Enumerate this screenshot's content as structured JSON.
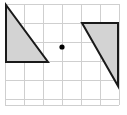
{
  "figure": {
    "type": "geometry-diagram",
    "canvas": {
      "width": 127,
      "height": 115
    },
    "background_color": "#ffffff"
  },
  "grid": {
    "name": "square-grid",
    "line_color": "#cfcfcf",
    "cell_size": 19,
    "columns": 6,
    "rows": 6,
    "origin_x": 5,
    "origin_y": 4,
    "x_positions": [
      5,
      24,
      43,
      62,
      81,
      100,
      119
    ],
    "y_positions": [
      4,
      23,
      42,
      61,
      80,
      99,
      105
    ]
  },
  "shapes": [
    {
      "name": "left-triangle",
      "kind": "right-triangle",
      "fill_color": "#d3d3d3",
      "stroke_color": "#1a1a1a",
      "stroke_width": 2,
      "points": "6,5 6,62 48,62",
      "vertices": [
        {
          "label": "top-left",
          "x": 6,
          "y": 5
        },
        {
          "label": "bottom-left",
          "x": 6,
          "y": 62
        },
        {
          "label": "bottom-right",
          "x": 48,
          "y": 62
        }
      ]
    },
    {
      "name": "right-triangle",
      "kind": "right-triangle",
      "fill_color": "#d3d3d3",
      "stroke_color": "#1a1a1a",
      "stroke_width": 2,
      "points": "82,23 118,23 118,86",
      "vertices": [
        {
          "label": "top-left",
          "x": 82,
          "y": 23
        },
        {
          "label": "top-right",
          "x": 118,
          "y": 23
        },
        {
          "label": "bottom-right",
          "x": 118,
          "y": 86
        }
      ]
    }
  ],
  "center_point": {
    "name": "center-dot",
    "x": 62,
    "y": 47,
    "radius": 2.6,
    "color": "#000000"
  }
}
